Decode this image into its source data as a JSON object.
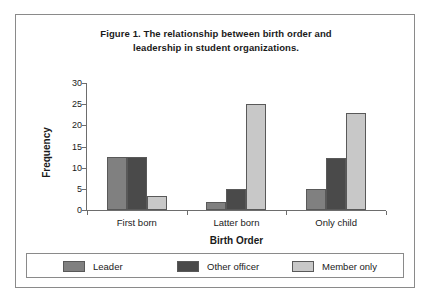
{
  "figure": {
    "title_line1": "Figure 1. The relationship between birth order and",
    "title_line2": "leadership in student organizations."
  },
  "chart_data": {
    "type": "bar",
    "title": "Figure 1. The relationship between birth order and leadership in student organizations.",
    "xlabel": "Birth Order",
    "ylabel": "Frequency",
    "categories": [
      "First born",
      "Latter born",
      "Only child"
    ],
    "series": [
      {
        "name": "Leader",
        "color": "#808080",
        "values": [
          12.5,
          2.0,
          5.0
        ]
      },
      {
        "name": "Other officer",
        "color": "#4a4a4a",
        "values": [
          12.5,
          5.0,
          12.4
        ]
      },
      {
        "name": "Member only",
        "color": "#c8c8c8",
        "values": [
          3.3,
          25.0,
          23.0
        ]
      }
    ],
    "ylim": [
      0,
      30
    ],
    "yticks": [
      0,
      5,
      10,
      15,
      20,
      25,
      30
    ],
    "ytick_labels": [
      "0",
      "5",
      "10",
      "15",
      "20",
      "25",
      "30"
    ],
    "grid": false,
    "legend_position": "bottom"
  },
  "legend": {
    "items": [
      {
        "label": "Leader",
        "color": "#808080"
      },
      {
        "label": "Other officer",
        "color": "#4a4a4a"
      },
      {
        "label": "Member only",
        "color": "#c8c8c8"
      }
    ]
  }
}
